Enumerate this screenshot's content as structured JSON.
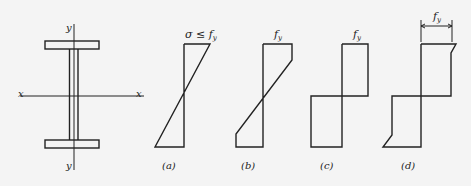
{
  "section": {
    "axis_x_left": "x",
    "axis_x_right": "x",
    "axis_y_top": "y",
    "axis_y_bottom": "y"
  },
  "diagrams": [
    {
      "id": "a",
      "top_label": "σ ≤ f",
      "top_sub": "y",
      "caption": "(a)"
    },
    {
      "id": "b",
      "top_label": "f",
      "top_sub": "y",
      "caption": "(b)"
    },
    {
      "id": "c",
      "top_label": "f",
      "top_sub": "y",
      "caption": "(c)"
    },
    {
      "id": "d",
      "top_label": "f",
      "top_sub": "y",
      "caption": "(d)"
    }
  ],
  "colors": {
    "stroke": "#222222",
    "background": "#f4f4f4"
  }
}
